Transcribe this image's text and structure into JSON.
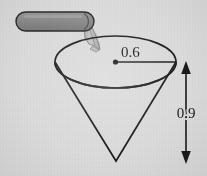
{
  "figure": {
    "kind": "geometry-diagram",
    "background_color": "#dcdcdc",
    "line_color": "#1f1f1f",
    "pipe_fill_color": "#8a8a8a",
    "pipe_stroke_color": "#2b2b2b",
    "water_color": "#b6b6b6"
  },
  "labels": {
    "radius": "0.6",
    "height": "0.9"
  },
  "geometry": {
    "cone": {
      "rim_center_x": 115.5,
      "rim_center_y": 62,
      "rim_rx": 60.5,
      "rim_ry": 26,
      "apex_x": 116,
      "apex_y": 161
    },
    "radius_line": {
      "x1": 115.5,
      "y1": 62,
      "x2": 176,
      "y2": 62
    },
    "dimension_line": {
      "x": 186,
      "y_top": 63,
      "y_bottom": 162
    },
    "pipe": {
      "x": 16,
      "y": 12,
      "width": 78,
      "height": 19,
      "radius": 9.5
    }
  }
}
